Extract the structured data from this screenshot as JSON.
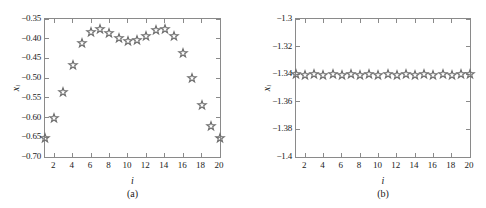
{
  "figure": {
    "marker_color": "#6e6e6e",
    "frame_color": "#8a8a8a",
    "background": "#ffffff"
  },
  "chart_data": [
    {
      "type": "scatter",
      "panel": "a",
      "title": "",
      "caption": "(a)",
      "xlabel": "i",
      "ylabel": "x",
      "ylabel_sub": "i",
      "marker": "pentagram-open",
      "grid": false,
      "legend": null,
      "xlim": [
        1,
        20
      ],
      "ylim": [
        -0.7,
        -0.35
      ],
      "xticks": [
        2,
        4,
        6,
        8,
        10,
        12,
        14,
        16,
        18,
        20
      ],
      "xticklabels": [
        "2",
        "4",
        "6",
        "8",
        "10",
        "12",
        "14",
        "16",
        "18",
        "20"
      ],
      "yticks": [
        -0.35,
        -0.4,
        -0.45,
        -0.5,
        -0.55,
        -0.6,
        -0.65,
        -0.7
      ],
      "yticklabels": [
        "−0.35",
        "−0.40",
        "−0.45",
        "−0.50",
        "−0.55",
        "−0.60",
        "−0.65",
        "−0.70"
      ],
      "x": [
        1,
        2,
        3,
        4,
        5,
        6,
        7,
        8,
        9,
        10,
        11,
        12,
        13,
        14,
        15,
        16,
        17,
        18,
        19,
        20
      ],
      "values": [
        -0.653,
        -0.601,
        -0.536,
        -0.467,
        -0.412,
        -0.382,
        -0.375,
        -0.385,
        -0.398,
        -0.406,
        -0.404,
        -0.393,
        -0.378,
        -0.376,
        -0.394,
        -0.436,
        -0.499,
        -0.568,
        -0.622,
        -0.653
      ]
    },
    {
      "type": "scatter",
      "panel": "b",
      "title": "",
      "caption": "(b)",
      "xlabel": "i",
      "ylabel": "x",
      "ylabel_sub": "i",
      "marker": "pentagram-open",
      "grid": false,
      "legend": null,
      "xlim": [
        1,
        20
      ],
      "ylim": [
        -1.4,
        -1.3
      ],
      "xticks": [
        2,
        4,
        6,
        8,
        10,
        12,
        14,
        16,
        18,
        20
      ],
      "xticklabels": [
        "2",
        "4",
        "6",
        "8",
        "10",
        "12",
        "14",
        "16",
        "18",
        "20"
      ],
      "yticks": [
        -1.3,
        -1.32,
        -1.34,
        -1.36,
        -1.38,
        -1.4
      ],
      "yticklabels": [
        "−1.3",
        "−1.32",
        "−1.34",
        "−1.36",
        "−1.38",
        "−1.4"
      ],
      "x": [
        1,
        2,
        3,
        4,
        5,
        6,
        7,
        8,
        9,
        10,
        11,
        12,
        13,
        14,
        15,
        16,
        17,
        18,
        19,
        20
      ],
      "values": [
        -1.34,
        -1.3403,
        -1.34,
        -1.3403,
        -1.34,
        -1.3403,
        -1.34,
        -1.3403,
        -1.34,
        -1.3403,
        -1.34,
        -1.3403,
        -1.34,
        -1.3403,
        -1.34,
        -1.3403,
        -1.34,
        -1.3403,
        -1.34,
        -1.34
      ]
    }
  ]
}
